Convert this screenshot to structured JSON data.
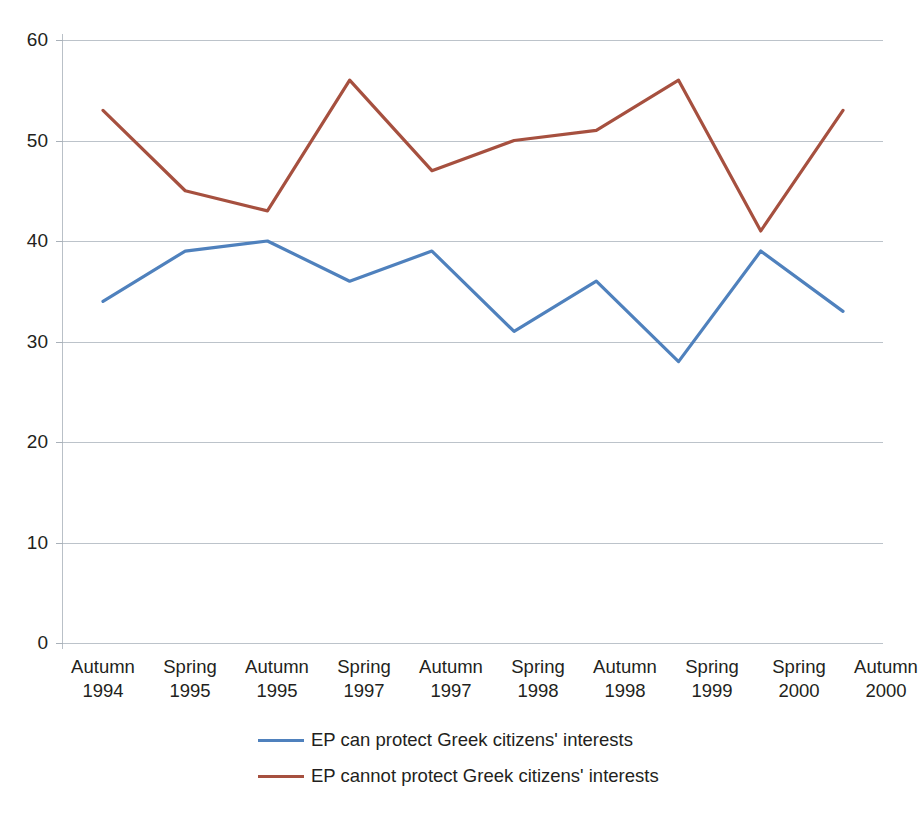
{
  "chart_data": {
    "type": "line",
    "title": "",
    "subtitle": "",
    "xlabel": "",
    "ylabel": "",
    "ylim": [
      0,
      60
    ],
    "yticks": [
      0,
      10,
      20,
      30,
      40,
      50,
      60
    ],
    "grid": true,
    "legend_position": "bottom",
    "categories": [
      "Autumn 1994",
      "Spring 1995",
      "Autumn 1995",
      "Spring 1997",
      "Autumn 1997",
      "Spring 1998",
      "Autumn 1998",
      "Spring 1999",
      "Spring 2000",
      "Autumn 2000"
    ],
    "category_lines": [
      [
        "Autumn",
        "1994"
      ],
      [
        "Spring",
        "1995"
      ],
      [
        "Autumn",
        "1995"
      ],
      [
        "Spring",
        "1997"
      ],
      [
        "Autumn",
        "1997"
      ],
      [
        "Spring",
        "1998"
      ],
      [
        "Autumn",
        "1998"
      ],
      [
        "Spring",
        "1999"
      ],
      [
        "Spring",
        "2000"
      ],
      [
        "Autumn",
        "2000"
      ]
    ],
    "series": [
      {
        "name": "EP can protect Greek citizens' interests",
        "color": "#4F81BD",
        "values": [
          34,
          39,
          40,
          36,
          39,
          31,
          36,
          28,
          39,
          33
        ]
      },
      {
        "name": "EP cannot protect Greek citizens' interests",
        "color": "#A6503F",
        "values": [
          53,
          45,
          43,
          56,
          47,
          50,
          51,
          56,
          41,
          53
        ]
      }
    ]
  },
  "axes": {
    "y_tick_labels": [
      "60",
      "50",
      "40",
      "30",
      "20",
      "10",
      "0"
    ],
    "gridline_color": "#bcc3ca",
    "axis_color": "#b9c0c7"
  },
  "legend": {
    "items": [
      {
        "label": "EP can protect Greek citizens' interests",
        "color": "#4F81BD"
      },
      {
        "label": "EP cannot protect Greek citizens' interests",
        "color": "#A6503F"
      }
    ]
  }
}
